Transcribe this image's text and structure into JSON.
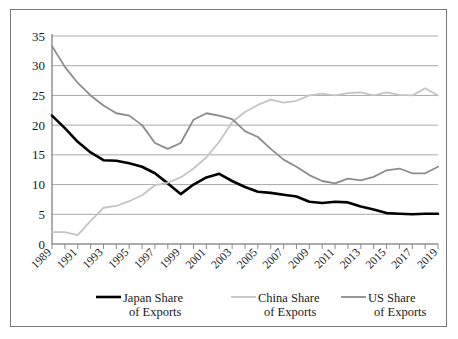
{
  "chart_data": {
    "type": "line",
    "title": "",
    "xlabel": "",
    "ylabel": "",
    "ylim": [
      0,
      35
    ],
    "yticks": [
      0,
      5,
      10,
      15,
      20,
      25,
      30,
      35
    ],
    "grid": true,
    "legend_position": "bottom",
    "x": [
      1989,
      1990,
      1991,
      1992,
      1993,
      1994,
      1995,
      1996,
      1997,
      1998,
      1999,
      2000,
      2001,
      2002,
      2003,
      2004,
      2005,
      2006,
      2007,
      2008,
      2009,
      2010,
      2011,
      2012,
      2013,
      2014,
      2015,
      2016,
      2017,
      2018,
      2019
    ],
    "xtick_labels": [
      "1989",
      "1991",
      "1993",
      "1995",
      "1997",
      "1999",
      "2001",
      "2003",
      "2005",
      "2007",
      "2009",
      "2011",
      "2013",
      "2015",
      "2017",
      "2019"
    ],
    "series": [
      {
        "name": "Japan Share of Exports",
        "color": "#000000",
        "width": 2.6,
        "values": [
          21.6,
          19.5,
          17.2,
          15.4,
          14.1,
          14.0,
          13.6,
          13.0,
          11.9,
          10.2,
          8.4,
          10.0,
          11.2,
          11.8,
          10.6,
          9.6,
          8.8,
          8.6,
          8.3,
          8.0,
          7.1,
          6.9,
          7.1,
          7.0,
          6.3,
          5.8,
          5.2,
          5.1,
          5.0,
          5.1,
          5.1
        ]
      },
      {
        "name": "China Share of Exports",
        "color": "#c4c4c4",
        "width": 1.8,
        "values": [
          2.0,
          2.0,
          1.5,
          3.9,
          6.1,
          6.4,
          7.2,
          8.2,
          9.9,
          10.3,
          11.2,
          12.7,
          14.6,
          17.2,
          20.5,
          22.2,
          23.4,
          24.3,
          23.8,
          24.1,
          25.0,
          25.3,
          25.0,
          25.4,
          25.5,
          25.0,
          25.5,
          25.1,
          25.0,
          26.2,
          25.0
        ]
      },
      {
        "name": "US Share of Exports",
        "color": "#8c8c8c",
        "width": 1.8,
        "values": [
          33.3,
          29.8,
          27.1,
          25.0,
          23.3,
          22.0,
          21.6,
          20.0,
          17.0,
          16.0,
          17.0,
          20.9,
          22.0,
          21.6,
          21.0,
          19.0,
          18.0,
          16.0,
          14.2,
          13.0,
          11.6,
          10.6,
          10.2,
          11.0,
          10.7,
          11.3,
          12.4,
          12.7,
          11.9,
          11.9,
          13.0
        ]
      }
    ]
  },
  "legend": {
    "items": [
      {
        "line1": "Japan Share",
        "line2": "of Exports",
        "color": "#000000"
      },
      {
        "line1": "China Share",
        "line2": "of Exports",
        "color": "#c4c4c4"
      },
      {
        "line1": "US Share",
        "line2": "of Exports",
        "color": "#8c8c8c"
      }
    ]
  }
}
